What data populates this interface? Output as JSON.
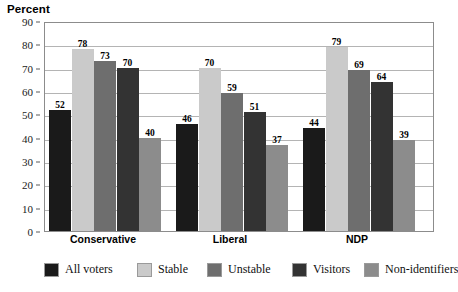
{
  "chart_data": {
    "type": "bar",
    "title": "Percent",
    "xlabel": "",
    "ylabel": "Percent",
    "ylim": [
      0,
      90
    ],
    "ytick_step": 10,
    "yticks": [
      0,
      10,
      20,
      30,
      40,
      50,
      60,
      70,
      80,
      90
    ],
    "grid": true,
    "legend_position": "bottom",
    "categories": [
      "Conservative",
      "Liberal",
      "NDP"
    ],
    "series": [
      {
        "name": "All voters",
        "color": "#1a1a1a",
        "values": [
          52,
          46,
          44
        ]
      },
      {
        "name": "Stable",
        "color": "#cacaca",
        "values": [
          78,
          70,
          79
        ]
      },
      {
        "name": "Unstable",
        "color": "#6e6e6e",
        "values": [
          73,
          59,
          69
        ]
      },
      {
        "name": "Visitors",
        "color": "#333333",
        "values": [
          70,
          51,
          64
        ]
      },
      {
        "name": "Non-identifiers",
        "color": "#8c8c8c",
        "values": [
          40,
          37,
          39
        ]
      }
    ]
  },
  "axis": {
    "tick_labels": [
      "90",
      "80",
      "70",
      "60",
      "50",
      "40",
      "30",
      "20",
      "10",
      "0"
    ]
  },
  "legend": {
    "items": [
      {
        "label": "All voters"
      },
      {
        "label": "Stable"
      },
      {
        "label": "Unstable"
      },
      {
        "label": "Visitors"
      },
      {
        "label": "Non-identifiers"
      }
    ]
  }
}
